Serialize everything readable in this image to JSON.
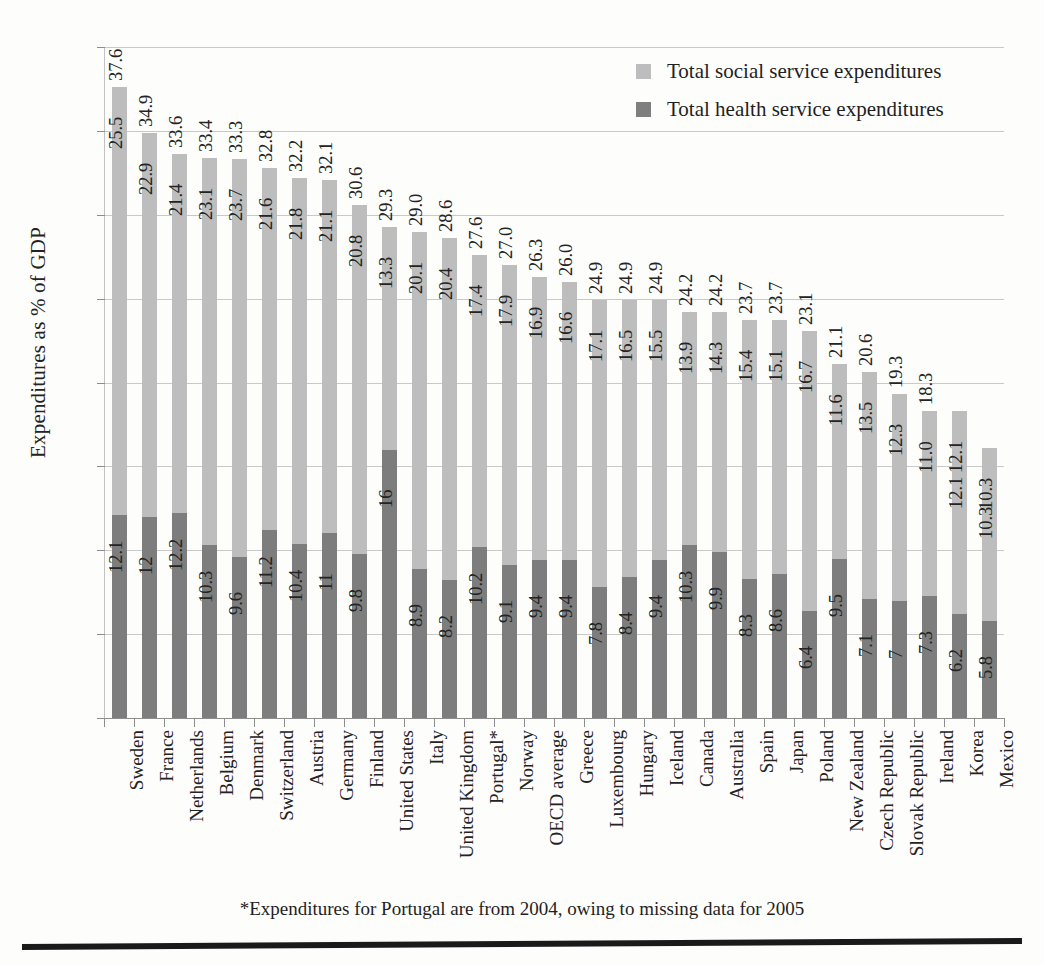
{
  "chart_data": {
    "type": "bar",
    "subtype": "stacked-bar",
    "title": "",
    "xlabel": "",
    "ylabel": "Expenditures as % of GDP",
    "ylim": [
      0,
      40
    ],
    "yticks": [
      0,
      5,
      10,
      15,
      20,
      25,
      30,
      35,
      40
    ],
    "grid": true,
    "legend_position": "top-right",
    "legend": [
      "Total social service expenditures",
      "Total health service expenditures"
    ],
    "categories": [
      "Sweden",
      "France",
      "Netherlands",
      "Belgium",
      "Denmark",
      "Switzerland",
      "Austria",
      "Germany",
      "Finland",
      "United States",
      "Italy",
      "United Kingdom",
      "Portugal*",
      "Norway",
      "OECD average",
      "Greece",
      "Luxembourg",
      "Hungary",
      "Iceland",
      "Canada",
      "Australia",
      "Spain",
      "Japan",
      "Poland",
      "New Zealand",
      "Czech Republic",
      "Slovak Republic",
      "Ireland",
      "Korea",
      "Mexico"
    ],
    "series": [
      {
        "name": "Total health service expenditures",
        "color": "#7d7d7d",
        "values": [
          12.1,
          12,
          12.2,
          10.3,
          9.6,
          11.2,
          10.4,
          11,
          9.8,
          16,
          8.9,
          8.2,
          10.2,
          9.1,
          9.4,
          9.4,
          7.8,
          8.4,
          9.4,
          10.3,
          9.9,
          8.3,
          8.6,
          6.4,
          9.5,
          7.1,
          7,
          7.3,
          6.2,
          5.8
        ],
        "labels": [
          "12.1",
          "12",
          "12.2",
          "10.3",
          "9.6",
          "11.2",
          "10.4",
          "11",
          "9.8",
          "16",
          "8.9",
          "8.2",
          "10.2",
          "9.1",
          "9.4",
          "9.4",
          "7.8",
          "8.4",
          "9.4",
          "10.3",
          "9.9",
          "8.3",
          "8.6",
          "6.4",
          "9.5",
          "7.1",
          "7",
          "7.3",
          "6.2",
          "5.8"
        ]
      },
      {
        "name": "Total social service expenditures",
        "color": "#bdbdbd",
        "values": [
          25.5,
          22.9,
          21.4,
          23.1,
          23.7,
          21.6,
          21.8,
          21.1,
          20.8,
          13.3,
          20.1,
          20.4,
          17.4,
          17.9,
          16.9,
          16.6,
          17.1,
          16.5,
          15.5,
          13.9,
          14.3,
          15.4,
          15.1,
          16.7,
          11.6,
          13.5,
          12.3,
          11.0,
          12.1,
          10.3
        ],
        "labels": [
          "25.5",
          "22.9",
          "21.4",
          "23.1",
          "23.7",
          "21.6",
          "21.8",
          "21.1",
          "20.8",
          "13.3",
          "20.1",
          "20.4",
          "17.4",
          "17.9",
          "16.9",
          "16.6",
          "17.1",
          "16.5",
          "15.5",
          "13.9",
          "14.3",
          "15.4",
          "15.1",
          "16.7",
          "11.6",
          "13.5",
          "12.3",
          "11.0",
          "12.1",
          "10.3"
        ]
      }
    ],
    "totals": [
      37.6,
      34.9,
      33.6,
      33.4,
      33.3,
      32.8,
      32.2,
      32.1,
      30.6,
      29.3,
      29.0,
      28.6,
      27.6,
      27.0,
      26.3,
      26.0,
      24.9,
      24.9,
      24.9,
      24.2,
      24.2,
      23.7,
      23.7,
      23.1,
      21.1,
      20.6,
      19.3,
      18.3,
      12.1,
      10.3
    ],
    "total_labels": [
      "37.6",
      "34.9",
      "33.6",
      "33.4",
      "33.3",
      "32.8",
      "32.2",
      "32.1",
      "30.6",
      "29.3",
      "29.0",
      "28.6",
      "27.6",
      "27.0",
      "26.3",
      "26.0",
      "24.9",
      "24.9",
      "24.9",
      "24.2",
      "24.2",
      "23.7",
      "23.7",
      "23.1",
      "21.1",
      "20.6",
      "19.3",
      "18.3",
      "12.1",
      "10.3"
    ],
    "footnote": "*Expenditures for Portugal are from 2004, owing to missing data for 2005",
    "colors": {
      "social": "#bdbdbd",
      "health": "#7d7d7d",
      "gridline": "#c9c9c9",
      "axis": "#8d8d8d",
      "text": "#232323",
      "rule": "#1a1a1a"
    }
  }
}
